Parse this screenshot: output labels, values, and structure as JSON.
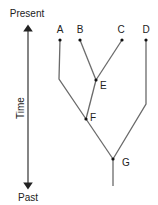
{
  "diagram": {
    "type": "phylogenetic-tree",
    "axis": {
      "label": "Time",
      "top_label": "Present",
      "bottom_label": "Past"
    },
    "tips": [
      {
        "id": "A",
        "label": "A"
      },
      {
        "id": "B",
        "label": "B"
      },
      {
        "id": "C",
        "label": "C"
      },
      {
        "id": "D",
        "label": "D"
      }
    ],
    "internal_nodes": [
      {
        "id": "E",
        "label": "E",
        "children": [
          "B",
          "C"
        ]
      },
      {
        "id": "F",
        "label": "F",
        "children": [
          "A",
          "E"
        ]
      },
      {
        "id": "G",
        "label": "G",
        "children": [
          "F",
          "D"
        ]
      }
    ],
    "colors": {
      "edge": "#6a6a6a",
      "node": "#111111",
      "text": "#222222"
    }
  }
}
